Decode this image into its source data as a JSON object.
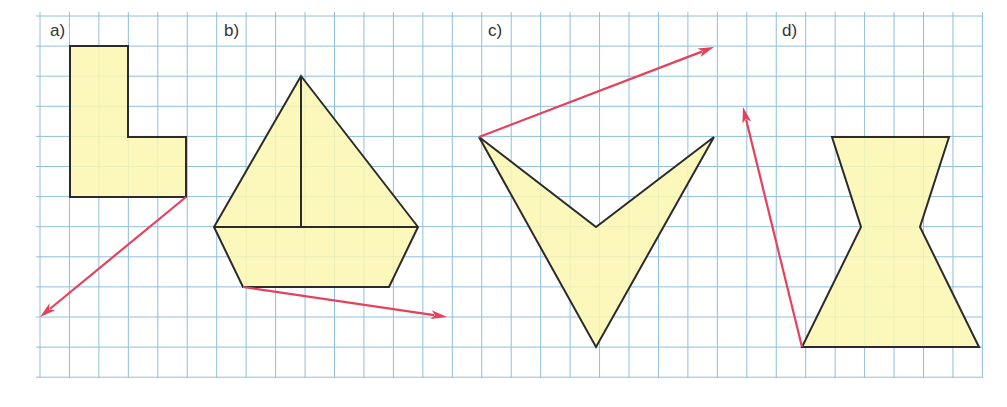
{
  "grid": {
    "x0": 40,
    "y0": 16,
    "cell": 29.45,
    "cols": 32,
    "rows": 12,
    "line_color": "#8fbfdc",
    "left_edge": 36,
    "right_edge": 982,
    "bottom_edge": 378
  },
  "colors": {
    "fill": "#fbf7b0",
    "stroke": "#2b2b2b",
    "arrow": "#e5415a"
  },
  "figures": [
    {
      "label": "a)",
      "label_pos": [
        50,
        21
      ],
      "polygons": [
        [
          [
            70,
            46
          ],
          [
            128,
            46
          ],
          [
            128,
            137
          ],
          [
            186,
            137
          ],
          [
            186,
            197
          ],
          [
            70,
            197
          ]
        ]
      ],
      "segments": [],
      "arrow": {
        "from": [
          186,
          197
        ],
        "to": [
          40,
          317
        ]
      }
    },
    {
      "label": "b)",
      "label_pos": [
        224,
        21
      ],
      "polygons": [
        [
          [
            301,
            76
          ],
          [
            418,
            227
          ],
          [
            389,
            287
          ],
          [
            243,
            287
          ],
          [
            214,
            227
          ]
        ]
      ],
      "segments": [
        [
          [
            301,
            76
          ],
          [
            301,
            227
          ]
        ],
        [
          [
            214,
            227
          ],
          [
            418,
            227
          ]
        ]
      ],
      "arrow": {
        "from": [
          243,
          287
        ],
        "to": [
          447,
          317
        ]
      }
    },
    {
      "label": "c)",
      "label_pos": [
        488,
        21
      ],
      "polygons": [
        [
          [
            479,
            137
          ],
          [
            596,
            227
          ],
          [
            714,
            137
          ],
          [
            596,
            347
          ]
        ]
      ],
      "segments": [],
      "arrow": {
        "from": [
          479,
          137
        ],
        "to": [
          714,
          47
        ]
      }
    },
    {
      "label": "d)",
      "label_pos": [
        782,
        21
      ],
      "polygons": [
        [
          [
            832,
            137
          ],
          [
            949,
            137
          ],
          [
            920,
            227
          ],
          [
            979,
            347
          ],
          [
            802,
            347
          ],
          [
            861,
            227
          ]
        ]
      ],
      "segments": [],
      "arrow": {
        "from": [
          802,
          347
        ],
        "to": [
          743,
          107
        ]
      }
    }
  ]
}
